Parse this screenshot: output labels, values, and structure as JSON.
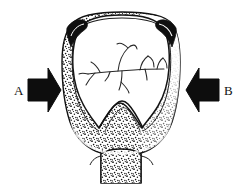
{
  "figure": {
    "background_color": "#ffffff",
    "ink_color": "#111111",
    "stipple_color": "#1a1a1a",
    "width": 245,
    "height": 184,
    "labels": [
      {
        "id": "A",
        "text": "A",
        "x": 16,
        "y": 91,
        "meaning": "left compression force label"
      },
      {
        "id": "B",
        "text": "B",
        "x": 224,
        "y": 91,
        "meaning": "right compression force label"
      }
    ],
    "arrows": [
      {
        "id": "arrow-a",
        "direction": "right",
        "label": "A",
        "fill": "#0d0d0d",
        "x": 28,
        "y": 68,
        "width": 33,
        "height": 44
      },
      {
        "id": "arrow-b",
        "direction": "left",
        "label": "B",
        "fill": "#0d0d0d",
        "x": 186,
        "y": 68,
        "width": 33,
        "height": 44
      }
    ],
    "specimen": {
      "name": "stippled cross-section",
      "outer_outline": "rounded dome crown with flared stippled walls and a central basal stem",
      "crown_fill": "#ffffff",
      "wall_fill": "stipple",
      "cusp_hooks": 2,
      "stem": {
        "x": 101,
        "y": 152,
        "width": 40,
        "height": 32
      }
    },
    "vein_pattern": {
      "name": "branching vascular pattern",
      "branch_count": 9,
      "stroke": "#262626"
    }
  }
}
